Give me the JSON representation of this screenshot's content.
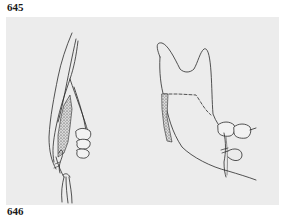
{
  "figure": {
    "label_top": "645",
    "label_bottom": "646",
    "panel_background": "#ececec",
    "line_color": "#2a2a2a",
    "illustrations": [
      {
        "name": "frontal-section-mandible-graft",
        "description": "Cross-section line drawing of mandible with stippled bone graft, molar teeth and suture"
      },
      {
        "name": "lateral-mandible-ramus-graft",
        "description": "Lateral view of mandibular ramus with stippled donor site, dashed osteotomy line, two molars and suture"
      }
    ]
  }
}
